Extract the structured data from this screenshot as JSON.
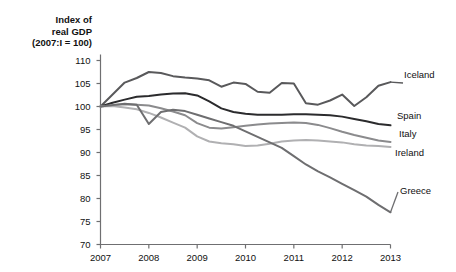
{
  "chart_data": {
    "type": "line",
    "title_lines": [
      "Index of",
      "real GDP",
      "(2007:I = 100)"
    ],
    "xlabel": "",
    "ylabel": "Index of real GDP (2007:I = 100)",
    "xlim": [
      2007,
      2013
    ],
    "ylim": [
      70,
      110
    ],
    "yticks": [
      70,
      75,
      80,
      85,
      90,
      95,
      100,
      105,
      110
    ],
    "ytick_labels": [
      "70",
      "75",
      "80",
      "85",
      "90",
      "95",
      "100",
      "105",
      "110"
    ],
    "xticks": [
      2007,
      2008,
      2009,
      2010,
      2011,
      2012,
      2013
    ],
    "xtick_labels": [
      "2007",
      "2008",
      "2009",
      "2010",
      "2011",
      "2012",
      "2013"
    ],
    "grid": false,
    "legend_position": "right-inline-labels",
    "x": [
      2007.0,
      2007.25,
      2007.5,
      2007.75,
      2008.0,
      2008.25,
      2008.5,
      2008.75,
      2009.0,
      2009.25,
      2009.5,
      2009.75,
      2010.0,
      2010.25,
      2010.5,
      2010.75,
      2011.0,
      2011.25,
      2011.5,
      2011.75,
      2012.0,
      2012.25,
      2012.5,
      2012.75,
      2013.0
    ],
    "series": [
      {
        "name": "Iceland",
        "color": "#59595b",
        "width": 2.0,
        "values": [
          100.0,
          102.6,
          105.2,
          106.2,
          107.5,
          107.3,
          106.6,
          106.3,
          106.1,
          105.7,
          104.3,
          105.2,
          104.9,
          103.2,
          103.0,
          105.1,
          105.0,
          100.7,
          100.4,
          101.3,
          102.6,
          100.1,
          102.0,
          104.5,
          105.3
        ]
      },
      {
        "name": "Spain",
        "color": "#2b2b2d",
        "width": 2.0,
        "values": [
          100.0,
          100.8,
          101.5,
          102.1,
          102.3,
          102.6,
          102.8,
          102.9,
          102.4,
          101.1,
          99.6,
          98.8,
          98.4,
          98.2,
          98.2,
          98.2,
          98.3,
          98.3,
          98.2,
          98.1,
          97.8,
          97.3,
          96.8,
          96.2,
          95.9
        ]
      },
      {
        "name": "Italy",
        "color": "#8b8b8d",
        "width": 2.0,
        "values": [
          100.0,
          100.3,
          100.5,
          100.4,
          100.2,
          99.6,
          98.9,
          98.1,
          96.4,
          95.4,
          95.2,
          95.5,
          95.8,
          96.1,
          96.3,
          96.4,
          96.5,
          96.4,
          96.0,
          95.3,
          94.5,
          93.8,
          93.2,
          92.6,
          92.3
        ]
      },
      {
        "name": "Ireland",
        "color": "#b0b0b2",
        "width": 2.0,
        "values": [
          100.0,
          100.1,
          99.8,
          99.4,
          98.6,
          97.6,
          96.5,
          95.4,
          93.5,
          92.4,
          92.0,
          91.8,
          91.4,
          91.5,
          91.9,
          92.4,
          92.6,
          92.7,
          92.6,
          92.4,
          92.2,
          91.8,
          91.5,
          91.4,
          91.2
        ]
      },
      {
        "name": "Greece",
        "color": "#6e6e70",
        "width": 2.0,
        "values": [
          100.0,
          100.3,
          100.6,
          100.4,
          96.2,
          98.8,
          99.3,
          99.0,
          98.2,
          97.4,
          96.6,
          95.8,
          94.6,
          93.4,
          92.2,
          91.0,
          89.2,
          87.4,
          85.9,
          84.6,
          83.2,
          81.8,
          80.4,
          78.6,
          77.0
        ]
      }
    ],
    "annotations": [
      {
        "text": "Iceland",
        "series": "Iceland"
      },
      {
        "text": "Spain",
        "series": "Spain"
      },
      {
        "text": "Italy",
        "series": "Italy"
      },
      {
        "text": "Ireland",
        "series": "Ireland"
      },
      {
        "text": "Greece",
        "series": "Greece"
      }
    ]
  },
  "axis": {
    "color": "#6f6f71"
  }
}
